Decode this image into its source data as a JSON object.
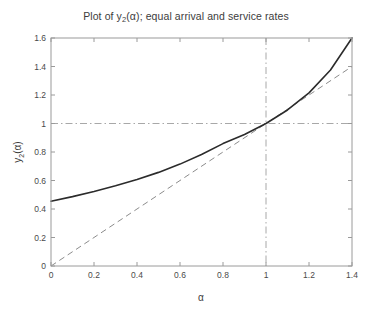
{
  "figure": {
    "title_prefix": "Plot of y",
    "title_sub": "2",
    "title_suffix": "(α); equal arrival and service rates",
    "background_color": "#ffffff"
  },
  "chart_data": {
    "type": "line",
    "title": "Plot of y2(α); equal arrival and service rates",
    "xlabel": "α",
    "ylabel": "y2(α)",
    "xlim": [
      0,
      1.4
    ],
    "ylim": [
      0,
      1.6
    ],
    "grid": false,
    "legend": "none",
    "xticks": [
      0,
      0.2,
      0.4,
      0.6,
      0.8,
      1,
      1.2,
      1.4
    ],
    "xtick_labels": [
      "0",
      "0.2",
      "0.4",
      "0.6",
      "0.8",
      "1",
      "1.2",
      "1.4"
    ],
    "yticks": [
      0,
      0.2,
      0.4,
      0.6,
      0.8,
      1,
      1.2,
      1.4,
      1.6
    ],
    "ytick_labels": [
      "0",
      "0.2",
      "0.4",
      "0.6",
      "0.8",
      "1",
      "1.2",
      "1.4",
      "1.6"
    ],
    "series": [
      {
        "name": "y2(alpha)",
        "style": "solid",
        "color": "#2b2b2b",
        "width": 1.6,
        "x": [
          0,
          0.1,
          0.2,
          0.3,
          0.4,
          0.5,
          0.6,
          0.7,
          0.8,
          0.9,
          1.0,
          1.1,
          1.2,
          1.3,
          1.4
        ],
        "values": [
          0.455,
          0.487,
          0.523,
          0.563,
          0.607,
          0.657,
          0.715,
          0.782,
          0.859,
          0.923,
          1.0,
          1.095,
          1.215,
          1.375,
          1.6
        ]
      },
      {
        "name": "identity y = alpha",
        "style": "dashed",
        "color": "#8c8c8c",
        "width": 1.0,
        "x": [
          0,
          1.4
        ],
        "values": [
          0,
          1.4
        ]
      }
    ],
    "reference_lines": [
      {
        "name": "vertical-reference-alpha-1",
        "orientation": "vertical",
        "value": 1,
        "style": "dash-dot",
        "color": "#a8a8a8"
      },
      {
        "name": "horizontal-reference-y-1",
        "orientation": "horizontal",
        "value": 1,
        "style": "dash-dot",
        "color": "#a8a8a8"
      }
    ],
    "intersection_point": {
      "x": 1,
      "y": 1
    },
    "annotations": []
  }
}
